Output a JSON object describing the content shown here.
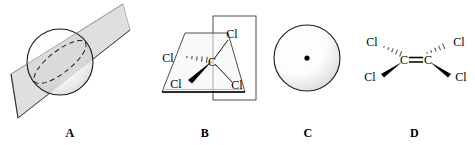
{
  "figure": {
    "background_color": "#ffffff",
    "line_color": "#1a1a1a",
    "plane_fill_color": "#d8d8d8",
    "wedge_color": "#000000",
    "panel_count": 4
  },
  "panels": [
    {
      "id": "panel-a",
      "label": "A",
      "description": "sphere bisected by a diagonal mirror plane",
      "shapes": {
        "sphere": {
          "cx": 60,
          "cy": 62,
          "r": 33
        },
        "plane": "parallelogram",
        "intersection": "dashed-ellipse"
      },
      "atom_labels": []
    },
    {
      "id": "panel-b",
      "label": "B",
      "description": "tetrahedral carbon with four chlorine atoms and two intersecting mirror planes",
      "shapes": {
        "horizontal_plane": "trapezoid",
        "vertical_plane": "rectangle"
      },
      "atom_labels": [
        {
          "text": "Cl",
          "position": "upper-left",
          "bond": "hashed-wedge"
        },
        {
          "text": "Cl",
          "position": "lower-left",
          "bond": "solid-wedge"
        },
        {
          "text": "Cl",
          "position": "upper-right",
          "bond": "plain-line"
        },
        {
          "text": "Cl",
          "position": "lower-right",
          "bond": "plain-line"
        },
        {
          "text": "C",
          "position": "center",
          "bond": "none"
        }
      ]
    },
    {
      "id": "panel-c",
      "label": "C",
      "description": "sphere with a center of symmetry marked by a dot",
      "shapes": {
        "sphere": {
          "cx": 45,
          "cy": 58,
          "r": 33
        },
        "center_point": {
          "cx": 45,
          "cy": 58,
          "r": 2.6
        }
      },
      "atom_labels": []
    },
    {
      "id": "panel-d",
      "label": "D",
      "description": "tetrachloroethylene with carbon-carbon double bond",
      "shapes": {
        "bond": "double-bond"
      },
      "atom_labels": [
        {
          "text": "Cl",
          "position": "upper-left",
          "bond": "hashed-wedge"
        },
        {
          "text": "Cl",
          "position": "lower-left",
          "bond": "solid-wedge"
        },
        {
          "text": "C",
          "position": "center-left",
          "bond": "none"
        },
        {
          "text": "C",
          "position": "center-right",
          "bond": "none"
        },
        {
          "text": "Cl",
          "position": "upper-right",
          "bond": "hashed-wedge"
        },
        {
          "text": "Cl",
          "position": "lower-right",
          "bond": "solid-wedge"
        }
      ]
    }
  ]
}
